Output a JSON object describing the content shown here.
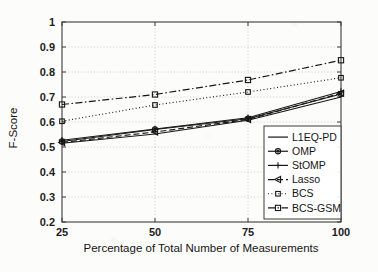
{
  "chart_data": {
    "type": "line",
    "title": "",
    "xlabel": "Percentage of Total Number of Measurements",
    "ylabel": "F-Score",
    "x": [
      25,
      50,
      75,
      100
    ],
    "xticklabels": [
      "25",
      "50",
      "75",
      "100"
    ],
    "yticklabels": [
      "0.2",
      "0.3",
      "0.4",
      "0.5",
      "0.6",
      "0.7",
      "0.8",
      "0.9",
      "1"
    ],
    "xlim": [
      25,
      100
    ],
    "ylim": [
      0.2,
      1.0
    ],
    "grid": true,
    "legend_position": "lower right",
    "series": [
      {
        "name": "L1EQ-PD",
        "values": [
          0.515,
          0.552,
          0.607,
          0.7
        ],
        "linestyle": "solid",
        "marker": "none",
        "color": "#171717"
      },
      {
        "name": "OMP",
        "values": [
          0.522,
          0.57,
          0.613,
          0.712
        ],
        "linestyle": "solid",
        "marker": "circle",
        "color": "#171717"
      },
      {
        "name": "StOMP",
        "values": [
          0.527,
          0.572,
          0.617,
          0.722
        ],
        "linestyle": "solid",
        "marker": "plus",
        "color": "#171717"
      },
      {
        "name": "Lasso",
        "values": [
          0.518,
          0.56,
          0.61,
          0.715
        ],
        "linestyle": "dashed",
        "marker": "triangle-left",
        "color": "#171717"
      },
      {
        "name": "BCS",
        "values": [
          0.603,
          0.668,
          0.72,
          0.777
        ],
        "linestyle": "dotted",
        "marker": "square-filled",
        "color": "#171717"
      },
      {
        "name": "BCS-GSM",
        "values": [
          0.67,
          0.71,
          0.768,
          0.847
        ],
        "linestyle": "dashdot",
        "marker": "square-open",
        "color": "#171717"
      }
    ]
  },
  "legend": {
    "entries": [
      {
        "label": "L1EQ-PD"
      },
      {
        "label": "OMP"
      },
      {
        "label": "StOMP"
      },
      {
        "label": "Lasso"
      },
      {
        "label": "BCS"
      },
      {
        "label": "BCS-GSM"
      }
    ]
  },
  "colors": {
    "foreground": "#171717",
    "axis": "#3b3b3b",
    "grid": "#b9b9b9",
    "background": "#fcfcfb"
  }
}
